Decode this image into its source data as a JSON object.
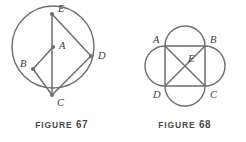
{
  "page": {
    "background_color": "#ffffff",
    "stroke_color": "#6e6e6e",
    "label_color": "#3d3d3d",
    "caption_color": "#4a4a4a",
    "width": 246,
    "height": 142
  },
  "figures": [
    {
      "id": "figure-67",
      "caption_word": "FIGURE",
      "caption_number": "67",
      "description": "Circle with center A; chord E-C vertical through center; B on circle at left; quadrilateral E-D-C with D outside circle to the right; radii A-B and segment B-C",
      "points": [
        {
          "name": "E",
          "x": 52,
          "y": 14,
          "label_dx": 6,
          "label_dy": -2,
          "dot": true
        },
        {
          "name": "A",
          "x": 53,
          "y": 47,
          "label_dx": 6,
          "label_dy": 2,
          "dot": true
        },
        {
          "name": "B",
          "x": 33,
          "y": 69,
          "label_dx": -13,
          "label_dy": -2,
          "dot": true
        },
        {
          "name": "C",
          "x": 52,
          "y": 95,
          "label_dx": 5,
          "label_dy": 11,
          "dot": true
        },
        {
          "name": "D",
          "x": 91,
          "y": 56,
          "label_dx": 7,
          "label_dy": 3,
          "dot": true
        }
      ],
      "circle": {
        "cx": 53,
        "cy": 47,
        "r": 41
      },
      "segments": [
        {
          "from": "E",
          "to": "C"
        },
        {
          "from": "E",
          "to": "D"
        },
        {
          "from": "D",
          "to": "C"
        },
        {
          "from": "A",
          "to": "B"
        },
        {
          "from": "B",
          "to": "C"
        }
      ]
    },
    {
      "id": "figure-68",
      "caption_word": "FIGURE",
      "caption_number": "68",
      "description": "Square ABCD with diagonals meeting at center E, and four outward semicircles drawn on the four sides of the square",
      "points": [
        {
          "name": "A",
          "x": 42,
          "y": 46,
          "label_dx": -12,
          "label_dy": -3,
          "dot": false
        },
        {
          "name": "B",
          "x": 82,
          "y": 46,
          "label_dx": 5,
          "label_dy": -3,
          "dot": false
        },
        {
          "name": "C",
          "x": 82,
          "y": 86,
          "label_dx": 5,
          "label_dy": 12,
          "dot": false
        },
        {
          "name": "D",
          "x": 42,
          "y": 86,
          "label_dx": -12,
          "label_dy": 12,
          "dot": false
        },
        {
          "name": "E",
          "x": 62,
          "y": 66,
          "label_dx": 3,
          "label_dy": -4,
          "dot": false
        }
      ],
      "square": {
        "x": 42,
        "y": 46,
        "size": 40
      },
      "segments": [
        {
          "from": "A",
          "to": "B"
        },
        {
          "from": "B",
          "to": "C"
        },
        {
          "from": "C",
          "to": "D"
        },
        {
          "from": "D",
          "to": "A"
        },
        {
          "from": "A",
          "to": "C"
        },
        {
          "from": "B",
          "to": "D"
        }
      ],
      "semicircles": [
        {
          "side": "top",
          "r": 20
        },
        {
          "side": "right",
          "r": 20
        },
        {
          "side": "bottom",
          "r": 20
        },
        {
          "side": "left",
          "r": 20
        }
      ]
    }
  ]
}
